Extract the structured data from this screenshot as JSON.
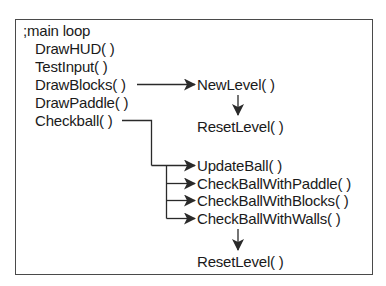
{
  "diagram": {
    "title_comment": ";main loop",
    "main_loop": [
      "DrawHUD( )",
      "TestInput( )",
      "DrawBlocks( )",
      "DrawPaddle( )",
      "Checkball( )"
    ],
    "draw_blocks_branch": {
      "first": "NewLevel( )",
      "then": "ResetLevel( )"
    },
    "checkball_branch": {
      "calls": [
        "UpdateBall( )",
        "CheckBallWithPaddle( )",
        "CheckBallWithBlocks( )",
        "CheckBallWithWalls( )"
      ],
      "then": "ResetLevel( )"
    },
    "colors": {
      "line": "#2a2a2a",
      "border": "#4a4a4a",
      "text": "#1a1a1a"
    }
  }
}
